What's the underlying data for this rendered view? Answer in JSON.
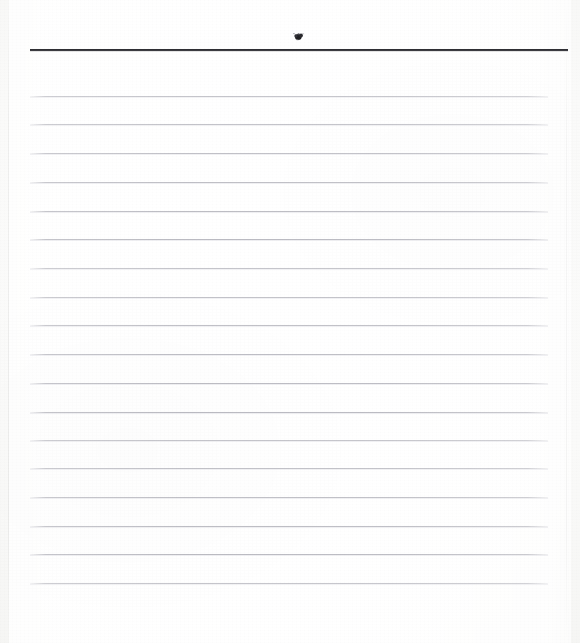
{
  "document": {
    "kind": "scanned-blank-ruled-page",
    "title": "Blank Lined Page",
    "page_width": 580,
    "page_height": 643,
    "paper_color": "#f7f7f5",
    "sheet_color": "#fdfdfd",
    "content_text": ""
  },
  "header": {
    "rule_color": "#232327",
    "rule_left": 30,
    "rule_right": 568,
    "rule_y": 49,
    "rule_thickness": 2,
    "mark": {
      "icon": "ink-blot-icon",
      "label": "",
      "color": "#1f1f22",
      "x": 292,
      "y": 31,
      "width": 13,
      "height": 10
    }
  },
  "ruled_area": {
    "line_color": "#b0b0b8",
    "line_left": 30,
    "line_right": 548,
    "line_count": 18,
    "first_line_y": 96,
    "line_spacing": 28.7,
    "last_line_y": 583,
    "line_y_positions": [
      96,
      124,
      153,
      182,
      211,
      239,
      268,
      297,
      325,
      354,
      383,
      412,
      440,
      468,
      497,
      526,
      554,
      583
    ],
    "lines_text": [
      "",
      "",
      "",
      "",
      "",
      "",
      "",
      "",
      "",
      "",
      "",
      "",
      "",
      "",
      "",
      "",
      "",
      ""
    ]
  },
  "footer": {
    "blank_region_top": 585,
    "blank_region_height": 58,
    "text": ""
  }
}
